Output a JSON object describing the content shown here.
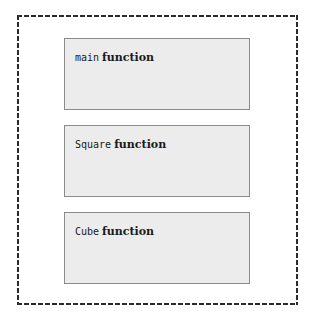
{
  "diagram": {
    "type": "function-block-diagram",
    "background_color": "#ffffff",
    "frame": {
      "style": "dashed",
      "border_color": "#2b2b2b",
      "fill": "none"
    },
    "block_style": {
      "fill_color": "#ececec",
      "border_color": "#8a8a8a",
      "text_color": "#1a1a1a"
    },
    "blocks": [
      {
        "id": "main",
        "name": "main",
        "kind": "function"
      },
      {
        "id": "square",
        "name": "Square",
        "kind": "function"
      },
      {
        "id": "cube",
        "name": "Cube",
        "kind": "function"
      }
    ]
  }
}
